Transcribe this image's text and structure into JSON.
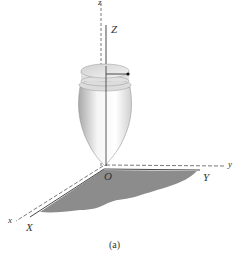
{
  "figure": {
    "caption": "(a)",
    "labels": {
      "z_fixed": "z",
      "Z_body": "Z",
      "y_fixed": "y",
      "Y_body": "Y",
      "x_fixed": "x",
      "X_body": "X",
      "origin": "O"
    },
    "colors": {
      "ground_shade": "#8c8c8c",
      "axis_line": "#444444",
      "top_body": "#e6e6e6"
    }
  }
}
